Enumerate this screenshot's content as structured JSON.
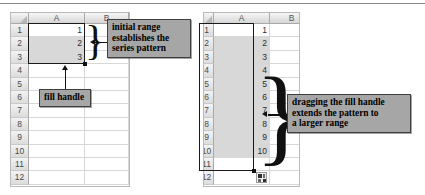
{
  "figure": {
    "top_rule": true
  },
  "left_panel": {
    "name": "initial-range-spreadsheet",
    "columns": [
      "A",
      "B"
    ],
    "row_labels": [
      "1",
      "2",
      "3",
      "4",
      "5",
      "6",
      "7",
      "8",
      "9",
      "10",
      "11",
      "12"
    ],
    "column_a_values": [
      "1",
      "2",
      "3",
      "",
      "",
      "",
      "",
      "",
      "",
      "",
      "",
      ""
    ],
    "column_b_values": [
      "",
      "",
      "",
      "",
      "",
      "",
      "",
      "",
      "",
      "",
      "",
      ""
    ],
    "selection": {
      "range": "A1:A3",
      "fill_handle": true
    },
    "callouts": [
      {
        "name": "initial-range-callout",
        "lines": [
          "initial range",
          "establishes the",
          "series pattern"
        ]
      },
      {
        "name": "fill-handle-callout",
        "lines": [
          "fill handle"
        ]
      }
    ]
  },
  "right_panel": {
    "name": "extended-series-spreadsheet",
    "columns": [
      "A",
      "B"
    ],
    "row_labels": [
      "1",
      "2",
      "3",
      "4",
      "5",
      "6",
      "7",
      "8",
      "9",
      "10",
      "11",
      "12"
    ],
    "column_a_values": [
      "1",
      "2",
      "3",
      "4",
      "5",
      "6",
      "7",
      "8",
      "9",
      "10",
      "",
      ""
    ],
    "column_b_values": [
      "",
      "",
      "",
      "",
      "",
      "",
      "",
      "",
      "",
      "",
      "",
      ""
    ],
    "selection": {
      "range": "A1:A10",
      "fill_handle": true
    },
    "autofill_options_button": {
      "name": "autofill-options-button",
      "label": ""
    },
    "callouts": [
      {
        "name": "dragging-fill-handle-callout",
        "lines": [
          "dragging the fill handle",
          "extends the pattern to",
          "a larger range"
        ]
      }
    ]
  },
  "colors": {
    "callout_bg": "#a6a6a6",
    "callout_border": "#3f3f3f",
    "selection_fill": "#d8d8d8",
    "grid_line": "#d7d7d7",
    "header_text": "#4a4a4a"
  }
}
